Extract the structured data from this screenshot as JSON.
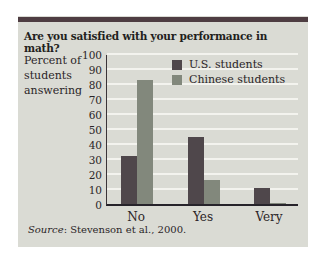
{
  "chart_data": {
    "type": "bar",
    "title": "Are you satisfied with your performance in math?",
    "ylabel": "Percent of\nstudents\nanswering",
    "xlabel": "",
    "categories": [
      "No",
      "Yes",
      "Very"
    ],
    "series": [
      {
        "name": "U.S. students",
        "color": "#4f474b",
        "values": [
          32,
          45,
          11
        ]
      },
      {
        "name": "Chinese students",
        "color": "#82887c",
        "values": [
          83,
          16,
          1
        ]
      }
    ],
    "ylim": [
      0,
      100
    ],
    "ytick_step": 10,
    "grid": true,
    "gridline_color": "#f3f3ee",
    "legend_position": "top-right-inside"
  },
  "source": {
    "prefix": "Source",
    "rest": ": Stevenson et al., 2000."
  },
  "colors": {
    "card_background": "#dadbd4",
    "top_rule": "#4e3d42",
    "axis": "#26232a",
    "text": "#2a2527"
  }
}
